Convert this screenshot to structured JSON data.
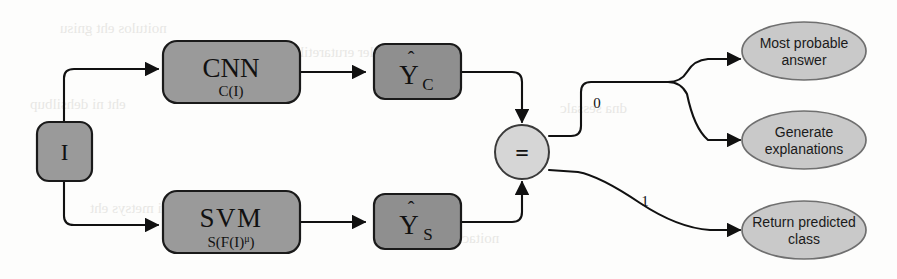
{
  "diagram": {
    "type": "flowchart",
    "colors": {
      "box_fill": "#9a9a9a",
      "box_stroke": "#1a1a1a",
      "circle_fill": "#d6d6d6",
      "ellipse_fill": "#c9c9c9",
      "ellipse_stroke": "#6f6f6f",
      "edge": "#111111",
      "background": "#fdfdfc"
    },
    "input": {
      "id": "input-image",
      "label": "I"
    },
    "models": [
      {
        "id": "cnn",
        "title": "CNN",
        "subtitle": "C(I)"
      },
      {
        "id": "svm",
        "title": "SVM",
        "subtitle_prefix": "S(F(I)",
        "subtitle_exponent": "μ",
        "subtitle_suffix": ")"
      }
    ],
    "predictions": [
      {
        "id": "y-cnn",
        "base": "Y",
        "hat": "ˆ",
        "subscript": "C"
      },
      {
        "id": "y-svm",
        "base": "Y",
        "hat": "ˆ",
        "subscript": "S"
      }
    ],
    "comparator": {
      "id": "equality-check",
      "symbol": "="
    },
    "edge_labels": {
      "not_equal": "0",
      "equal": "1"
    },
    "outcomes": [
      {
        "id": "most-probable-answer",
        "line1": "Most probable",
        "line2": "answer",
        "branch": "0"
      },
      {
        "id": "generate-explanations",
        "line1": "Generate",
        "line2": "explanations",
        "branch": "0"
      },
      {
        "id": "return-predicted-class",
        "line1": "Return predicted",
        "line2": "class",
        "branch": "1"
      }
    ]
  }
}
